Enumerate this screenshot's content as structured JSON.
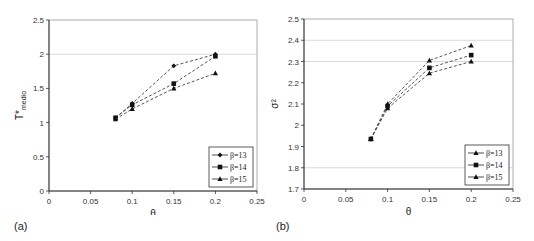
{
  "figure": {
    "panels": [
      "(a)",
      "(b)"
    ]
  },
  "chart_data": [
    {
      "type": "line",
      "panel_label": "(a)",
      "title": "",
      "xlabel": "θ",
      "ylabel": "T*medio",
      "ylabel_main": "T*",
      "ylabel_sub": "medio",
      "x": [
        0.08,
        0.1,
        0.15,
        0.2
      ],
      "xlim": [
        0,
        0.25
      ],
      "ylim": [
        0,
        2.5
      ],
      "xticks": [
        "0",
        "0.05",
        "0.1",
        "0.15",
        "0.2",
        "0.25"
      ],
      "yticks": [
        "0",
        "0.5",
        "1",
        "1.5",
        "2",
        "2.5"
      ],
      "gridlines_y": [
        2
      ],
      "legend_position": "lower right",
      "series": [
        {
          "name": "β=13",
          "marker": "diamond",
          "values": [
            1.07,
            1.28,
            1.83,
            2.0
          ]
        },
        {
          "name": "β=14",
          "marker": "square",
          "values": [
            1.07,
            1.26,
            1.57,
            1.97
          ]
        },
        {
          "name": "β=15",
          "marker": "triangle",
          "values": [
            1.05,
            1.2,
            1.5,
            1.72
          ]
        }
      ]
    },
    {
      "type": "line",
      "panel_label": "(b)",
      "title": "",
      "xlabel": "θ",
      "ylabel": "σ²",
      "x": [
        0.08,
        0.1,
        0.15,
        0.2
      ],
      "xlim": [
        0,
        0.25
      ],
      "ylim": [
        1.7,
        2.5
      ],
      "xticks": [
        "0",
        "0.05",
        "0.1",
        "0.15",
        "0.2",
        "0.25"
      ],
      "yticks": [
        "1.7",
        "1.8",
        "1.9",
        "2",
        "2.1",
        "2.2",
        "2.3",
        "2.4",
        "2.5"
      ],
      "gridlines_y": [
        1.8,
        2.3,
        2.4
      ],
      "legend_position": "lower right",
      "series": [
        {
          "name": "β=13",
          "marker": "triangle",
          "values": [
            1.935,
            2.1,
            2.305,
            2.375
          ]
        },
        {
          "name": "β=14",
          "marker": "square",
          "values": [
            1.935,
            2.09,
            2.27,
            2.33
          ]
        },
        {
          "name": "β=15",
          "marker": "triangle",
          "values": [
            1.935,
            2.08,
            2.245,
            2.3
          ]
        }
      ]
    }
  ]
}
